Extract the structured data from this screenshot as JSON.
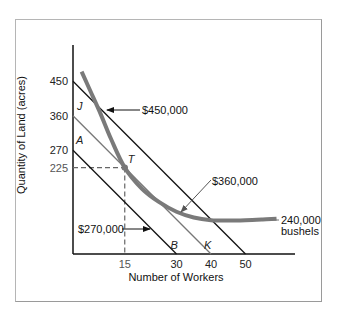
{
  "chart_data": {
    "type": "line",
    "title": "",
    "xlabel": "Number of Workers",
    "ylabel": "Quantity of Land (acres)",
    "xlim": [
      0,
      65
    ],
    "ylim": [
      0,
      540
    ],
    "grid": false,
    "x_ticks": [
      {
        "value": 15,
        "label": "15",
        "style": "gray"
      },
      {
        "value": 30,
        "label": "30",
        "style": "normal"
      },
      {
        "value": 40,
        "label": "40",
        "style": "normal"
      },
      {
        "value": 50,
        "label": "50",
        "style": "normal"
      }
    ],
    "y_ticks": [
      {
        "value": 450,
        "label": "450",
        "style": "normal"
      },
      {
        "value": 360,
        "label": "360",
        "style": "normal"
      },
      {
        "value": 270,
        "label": "270",
        "style": "normal"
      },
      {
        "value": 225,
        "label": "225",
        "style": "gray"
      }
    ],
    "series": [
      {
        "name": "$270,000",
        "kind": "isocost",
        "color": "#111111",
        "points": [
          [
            0,
            270
          ],
          [
            30,
            0
          ]
        ],
        "label": "$270,000"
      },
      {
        "name": "$360,000",
        "kind": "isocost",
        "color": "#777777",
        "points": [
          [
            0,
            360
          ],
          [
            40,
            0
          ]
        ],
        "label": "$360,000"
      },
      {
        "name": "$450,000",
        "kind": "isocost",
        "color": "#111111",
        "points": [
          [
            0,
            450
          ],
          [
            50,
            0
          ]
        ],
        "label": "$450,000"
      },
      {
        "name": "240,000 bushels",
        "kind": "isoquant",
        "color": "#7a7a7a",
        "points": [
          [
            2.5,
            475
          ],
          [
            5,
            425
          ],
          [
            8,
            365
          ],
          [
            11,
            300
          ],
          [
            15,
            225
          ],
          [
            20,
            170
          ],
          [
            25,
            135
          ],
          [
            30,
            110
          ],
          [
            35,
            95
          ],
          [
            40,
            88
          ],
          [
            45,
            87
          ],
          [
            50,
            88
          ],
          [
            55,
            90
          ],
          [
            59,
            92
          ]
        ],
        "label_lines": [
          "240,000",
          "bushels"
        ]
      }
    ],
    "points": [
      {
        "name": "J",
        "x": 0,
        "y": 360
      },
      {
        "name": "A",
        "x": 0,
        "y": 270
      },
      {
        "name": "T",
        "x": 15,
        "y": 225
      },
      {
        "name": "B",
        "x": 30,
        "y": 0
      },
      {
        "name": "K",
        "x": 40,
        "y": 0
      }
    ],
    "tangency": {
      "x": 15,
      "y": 225,
      "label": "T"
    },
    "annotations": [
      "$450,000",
      "$360,000",
      "$270,000",
      "240,000 bushels"
    ]
  }
}
